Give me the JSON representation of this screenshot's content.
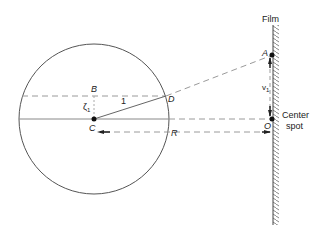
{
  "diagram": {
    "type": "geometry-optics",
    "colors": {
      "line": "#444444",
      "dash": "#9a9a9a",
      "text": "#222222"
    },
    "labels": {
      "film": "Film",
      "center_spot_line1": "Center",
      "center_spot_line2": "spot",
      "A": "A",
      "B": "B",
      "C": "C",
      "D": "D",
      "O": "O",
      "R": "R",
      "one": "1",
      "zeta": "ζ",
      "zeta_sub": "1",
      "v": "v",
      "v_sub": "1"
    },
    "geometry": {
      "circle": {
        "cx": 94,
        "cy": 119,
        "r": 75
      },
      "film_x": 273,
      "points": {
        "A": [
          272,
          55
        ],
        "C": [
          94,
          119
        ],
        "D": [
          166,
          96
        ],
        "O": [
          272,
          119
        ]
      }
    }
  }
}
